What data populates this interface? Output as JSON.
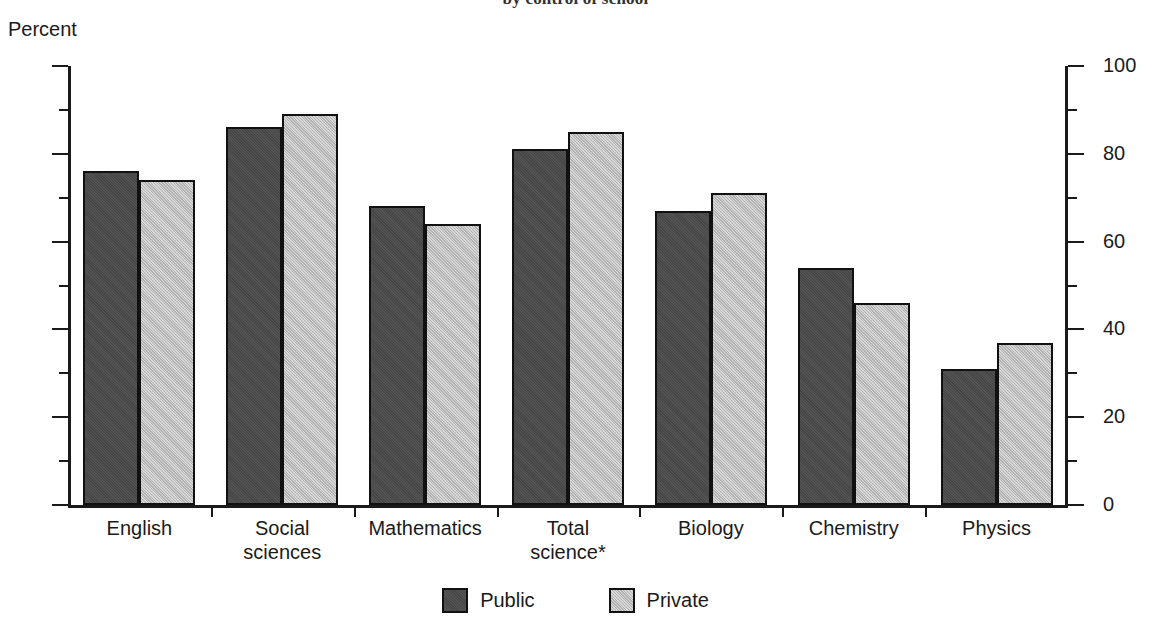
{
  "title": "by control of school",
  "y_axis_unit": "Percent",
  "legend": {
    "items": [
      {
        "label": "Public",
        "color": "#4a4a4a"
      },
      {
        "label": "Private",
        "color": "#c2c2c2"
      }
    ]
  },
  "axis": {
    "left_ticks": [
      "100",
      "80",
      "60",
      "40",
      "20",
      "0"
    ],
    "right_ticks": [
      "100",
      "80",
      "60",
      "40",
      "20",
      "0"
    ]
  },
  "chart_data": {
    "type": "bar",
    "title": "by control of school",
    "xlabel": "",
    "ylabel": "Percent",
    "ylim": [
      0,
      100
    ],
    "ytick_values": [
      0,
      20,
      40,
      60,
      80,
      100
    ],
    "yminor_tick_values": [
      10,
      30,
      50,
      70,
      90
    ],
    "grid": false,
    "legend_position": "bottom-center",
    "dual_y_axis": true,
    "footnote_marker": "*",
    "categories": [
      "English",
      "Social sciences",
      "Mathematics",
      "Total science*",
      "Biology",
      "Chemistry",
      "Physics"
    ],
    "category_lines": [
      [
        "English"
      ],
      [
        "Social",
        "sciences"
      ],
      [
        "Mathematics"
      ],
      [
        "Total",
        "science*"
      ],
      [
        "Biology"
      ],
      [
        "Chemistry"
      ],
      [
        "Physics"
      ]
    ],
    "series": [
      {
        "name": "Public",
        "color": "#4a4a4a",
        "values": [
          76,
          86,
          68,
          81,
          67,
          54,
          31
        ]
      },
      {
        "name": "Private",
        "color": "#c2c2c2",
        "values": [
          74,
          89,
          64,
          85,
          71,
          46,
          37
        ]
      }
    ]
  }
}
